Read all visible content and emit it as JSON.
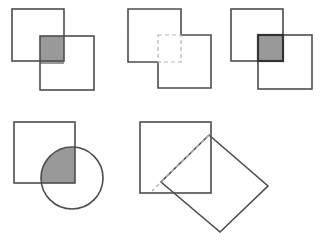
{
  "figure": {
    "background_color": "#ffffff",
    "outline_color": "#4d4d4d",
    "outline_color_dark": "#333333",
    "shade_color": "#999999",
    "dashed_color": "#b3b3b3",
    "width": 320,
    "height": 242
  },
  "panels": [
    {
      "id": "panel-intersection-shaded",
      "label": "Two overlapping squares with shaded intersection",
      "shapes": [
        {
          "name": "square-upper-left",
          "type": "square",
          "x": 12,
          "y": 9,
          "size": 52
        },
        {
          "name": "square-lower-right",
          "type": "square",
          "x": 40,
          "y": 36,
          "size": 54
        }
      ],
      "highlight": {
        "name": "intersection-region",
        "type": "rect",
        "x": 40,
        "y": 36,
        "width": 24,
        "height": 28,
        "fill": "#999999",
        "stroke": "none",
        "style": "shaded"
      }
    },
    {
      "id": "panel-union-outline",
      "label": "Union outline of two squares with intersection drawn dashed",
      "shapes": [
        {
          "name": "square-upper-left",
          "type": "square",
          "x": 10,
          "y": 9,
          "size": 53
        },
        {
          "name": "square-lower-right",
          "type": "square",
          "x": 40,
          "y": 35,
          "size": 53
        }
      ],
      "highlight": {
        "name": "intersection-region",
        "type": "rect",
        "x": 40,
        "y": 35,
        "width": 23,
        "height": 27,
        "fill": "none",
        "stroke": "#b3b3b3",
        "style": "dashed"
      }
    },
    {
      "id": "panel-intersection-outlined",
      "label": "Two overlapping squares with intersection shaded and outlined",
      "shapes": [
        {
          "name": "square-upper-left",
          "type": "square",
          "x": 9,
          "y": 9,
          "size": 52
        },
        {
          "name": "square-lower-right",
          "type": "square",
          "x": 36,
          "y": 35,
          "size": 54
        }
      ],
      "highlight": {
        "name": "intersection-region",
        "type": "rect",
        "x": 36,
        "y": 35,
        "width": 25,
        "height": 26,
        "fill": "#999999",
        "stroke": "#333333",
        "style": "shaded-outlined"
      }
    },
    {
      "id": "panel-square-circle",
      "label": "Square overlapping a circle with shaded intersection",
      "shapes": [
        {
          "name": "square",
          "type": "square",
          "x": 14,
          "y": 17,
          "size": 61
        },
        {
          "name": "circle",
          "type": "circle",
          "cx": 72,
          "cy": 73,
          "r": 31
        }
      ],
      "highlight": {
        "name": "intersection-region",
        "type": "circle-square-lens",
        "fill": "#999999",
        "stroke": "none",
        "style": "shaded"
      }
    },
    {
      "id": "panel-square-diamond",
      "label": "Square overlapping a rotated square with dashed intersection triangle",
      "shapes": [
        {
          "name": "square",
          "type": "square",
          "x": 10,
          "y": 17,
          "size": 71
        },
        {
          "name": "diamond",
          "type": "rotated-square",
          "cx": 90,
          "cy": 76,
          "half_diagonal": 48,
          "rotation_deg": 45
        }
      ],
      "highlight": {
        "name": "intersection-region",
        "type": "triangle",
        "points": "81,29 81,88 22,88",
        "fill": "none",
        "stroke": "#b3b3b3",
        "style": "dashed"
      }
    }
  ]
}
